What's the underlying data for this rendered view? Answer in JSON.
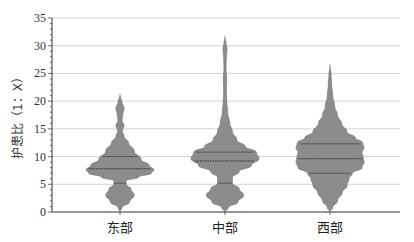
{
  "chart_data": {
    "type": "violin",
    "title": "",
    "xlabel": "",
    "ylabel": "护患比（1：X）",
    "ylim": [
      0,
      35
    ],
    "yticks": [
      0,
      5,
      10,
      15,
      20,
      25,
      30,
      35
    ],
    "grid": true,
    "legend": null,
    "categories": [
      "东部",
      "中部",
      "西部"
    ],
    "series": [
      {
        "name": "东部",
        "min": 0,
        "max": 21,
        "median": 7.8,
        "q1": 5.2,
        "q3": 10.0,
        "density_profile": [
          [
            0,
            0.0
          ],
          [
            0.8,
            0.06
          ],
          [
            1.8,
            0.28
          ],
          [
            3.0,
            0.42
          ],
          [
            4.2,
            0.32
          ],
          [
            5.0,
            0.18
          ],
          [
            5.6,
            0.18
          ],
          [
            6.3,
            0.55
          ],
          [
            7.0,
            0.92
          ],
          [
            7.6,
            1.0
          ],
          [
            8.4,
            0.86
          ],
          [
            9.5,
            0.62
          ],
          [
            11,
            0.42
          ],
          [
            12.5,
            0.25
          ],
          [
            13.6,
            0.12
          ],
          [
            14.6,
            0.07
          ],
          [
            15.6,
            0.12
          ],
          [
            16.5,
            0.06
          ],
          [
            17.5,
            0.08
          ],
          [
            18.7,
            0.12
          ],
          [
            19.8,
            0.06
          ],
          [
            21,
            0.0
          ]
        ]
      },
      {
        "name": "中部",
        "min": 0,
        "max": 31.5,
        "median": 9.2,
        "q1": 5.2,
        "q3": 10.8,
        "density_profile": [
          [
            0,
            0.0
          ],
          [
            0.8,
            0.1
          ],
          [
            1.8,
            0.38
          ],
          [
            3.0,
            0.55
          ],
          [
            4.2,
            0.42
          ],
          [
            5.2,
            0.22
          ],
          [
            6.2,
            0.22
          ],
          [
            7.3,
            0.42
          ],
          [
            8.4,
            0.78
          ],
          [
            9.6,
            1.0
          ],
          [
            10.8,
            0.92
          ],
          [
            11.8,
            0.6
          ],
          [
            13,
            0.35
          ],
          [
            14.5,
            0.22
          ],
          [
            16,
            0.14
          ],
          [
            18,
            0.08
          ],
          [
            20,
            0.05
          ],
          [
            22,
            0.04
          ],
          [
            24,
            0.05
          ],
          [
            26,
            0.03
          ],
          [
            28,
            0.04
          ],
          [
            29.5,
            0.06
          ],
          [
            30.5,
            0.03
          ],
          [
            31.5,
            0.0
          ]
        ]
      },
      {
        "name": "西部",
        "min": 0,
        "max": 26.3,
        "median": 9.6,
        "q1": 7.0,
        "q3": 12.3,
        "density_profile": [
          [
            0,
            0.0
          ],
          [
            0.8,
            0.08
          ],
          [
            2.0,
            0.22
          ],
          [
            3.5,
            0.36
          ],
          [
            4.8,
            0.5
          ],
          [
            6.0,
            0.56
          ],
          [
            7.0,
            0.66
          ],
          [
            8.0,
            0.94
          ],
          [
            9.0,
            1.0
          ],
          [
            9.8,
            0.98
          ],
          [
            10.8,
            0.94
          ],
          [
            11.6,
            1.0
          ],
          [
            12.5,
            0.96
          ],
          [
            13.4,
            0.74
          ],
          [
            14.5,
            0.5
          ],
          [
            16,
            0.34
          ],
          [
            17.5,
            0.22
          ],
          [
            19,
            0.14
          ],
          [
            21,
            0.08
          ],
          [
            23,
            0.05
          ],
          [
            25,
            0.03
          ],
          [
            26.3,
            0.0
          ]
        ]
      }
    ]
  },
  "colors": {
    "violin_fill": "#8c8c8c",
    "violin_stroke": "#6e6e6e",
    "quartile_line": "#4a4a4a",
    "median_line": "#2a2a2a",
    "grid": "#c8c8c8",
    "axis": "#333333"
  }
}
